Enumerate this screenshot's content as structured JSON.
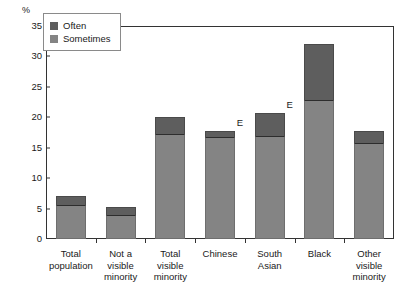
{
  "chart_data": {
    "type": "bar",
    "title": "",
    "subtitle": "",
    "xlabel": "",
    "ylabel": "%",
    "ylim": [
      0,
      35
    ],
    "ytick_values": [
      35,
      30,
      25,
      20,
      15,
      10,
      5,
      0
    ],
    "ytick_labels": [
      "35",
      "30",
      "25",
      "20",
      "15",
      "10",
      "5",
      "0"
    ],
    "grid": false,
    "stacked": true,
    "legend_position": "upper-left-inside",
    "categories": [
      "Total population",
      "Not a visible minority",
      "Total visible minority",
      "Chinese",
      "South Asian",
      "Black",
      "Other visible minority"
    ],
    "category_lines": [
      [
        "Total",
        "population"
      ],
      [
        "Not a",
        "visible",
        "minority"
      ],
      [
        "Total",
        "visible",
        "minority"
      ],
      [
        "Chinese"
      ],
      [
        "South",
        "Asian"
      ],
      [
        "Black"
      ],
      [
        "Other",
        "visible",
        "minority"
      ]
    ],
    "series": [
      {
        "name": "Sometimes",
        "color": "#848484",
        "values": [
          5.6,
          3.9,
          17.3,
          16.8,
          17.0,
          22.8,
          15.8
        ]
      },
      {
        "name": "Often",
        "color": "#5e5e5e",
        "values": [
          1.5,
          1.3,
          2.7,
          0.9,
          3.7,
          9.2,
          1.9
        ]
      }
    ],
    "totals": [
      7.1,
      5.2,
      20.0,
      17.7,
      20.7,
      32.0,
      17.7
    ],
    "annotations": [
      {
        "text": "E",
        "category": "Chinese",
        "value": 17.7
      },
      {
        "text": "E",
        "category": "South Asian",
        "value": 20.7
      }
    ]
  },
  "legend": {
    "items": [
      {
        "label": "Often",
        "color": "#5e5e5e"
      },
      {
        "label": "Sometimes",
        "color": "#848484"
      }
    ]
  },
  "axis": {
    "unit_label": "%"
  }
}
